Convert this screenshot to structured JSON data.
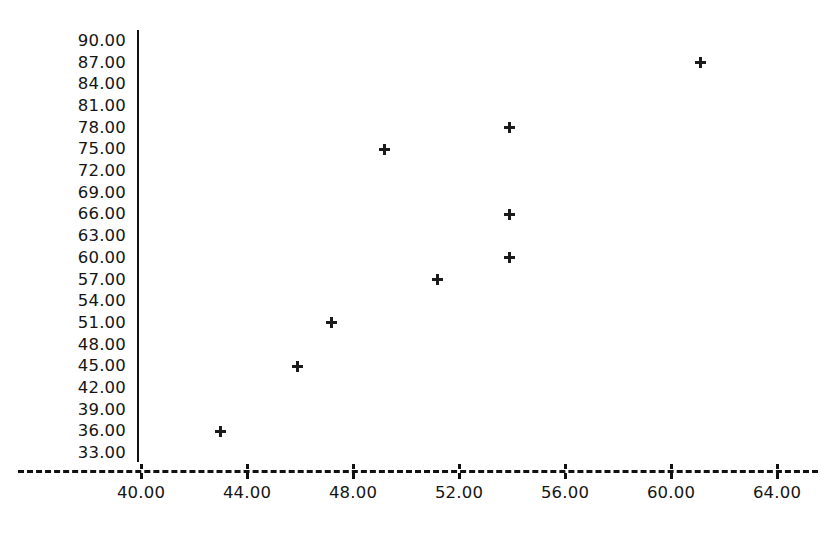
{
  "chart_data": {
    "type": "scatter",
    "title": "",
    "subtitle": "",
    "xlabel": "",
    "ylabel": "",
    "xlim": [
      38.0,
      65.0
    ],
    "ylim": [
      33.0,
      90.0
    ],
    "grid": false,
    "legend": null,
    "marker": "plus",
    "marker_color": "#1b1b1b",
    "axis_color": "#111111",
    "background_color": "#ffffff",
    "x_ticks": [
      {
        "value": 40,
        "label": "40.00"
      },
      {
        "value": 44,
        "label": "44.00"
      },
      {
        "value": 48,
        "label": "48.00"
      },
      {
        "value": 52,
        "label": "52.00"
      },
      {
        "value": 56,
        "label": "56.00"
      },
      {
        "value": 60,
        "label": "60.00"
      },
      {
        "value": 64,
        "label": "64.00"
      }
    ],
    "y_ticks": [
      {
        "value": 90,
        "label": "90.00"
      },
      {
        "value": 87,
        "label": "87.00"
      },
      {
        "value": 84,
        "label": "84.00"
      },
      {
        "value": 81,
        "label": "81.00"
      },
      {
        "value": 78,
        "label": "78.00"
      },
      {
        "value": 75,
        "label": "75.00"
      },
      {
        "value": 72,
        "label": "72.00"
      },
      {
        "value": 69,
        "label": "69.00"
      },
      {
        "value": 66,
        "label": "66.00"
      },
      {
        "value": 63,
        "label": "63.00"
      },
      {
        "value": 60,
        "label": "60.00"
      },
      {
        "value": 57,
        "label": "57.00"
      },
      {
        "value": 54,
        "label": "54.00"
      },
      {
        "value": 51,
        "label": "51.00"
      },
      {
        "value": 48,
        "label": "48.00"
      },
      {
        "value": 45,
        "label": "45.00"
      },
      {
        "value": 42,
        "label": "42.00"
      },
      {
        "value": 39,
        "label": "39.00"
      },
      {
        "value": 36,
        "label": "36.00"
      },
      {
        "value": 33,
        "label": "33.00"
      }
    ],
    "points": [
      {
        "x": 43.0,
        "y": 36
      },
      {
        "x": 45.9,
        "y": 45
      },
      {
        "x": 47.2,
        "y": 51
      },
      {
        "x": 49.2,
        "y": 75
      },
      {
        "x": 51.2,
        "y": 57
      },
      {
        "x": 53.9,
        "y": 78
      },
      {
        "x": 53.9,
        "y": 66
      },
      {
        "x": 53.9,
        "y": 60
      },
      {
        "x": 61.1,
        "y": 87
      }
    ]
  }
}
